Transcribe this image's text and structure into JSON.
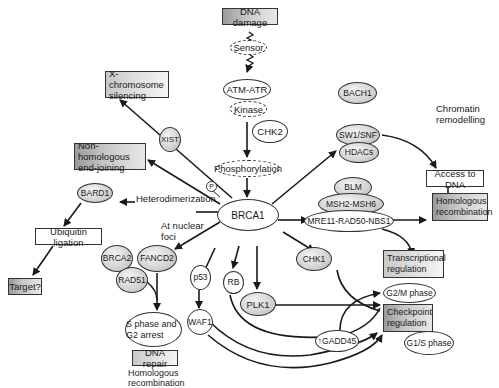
{
  "diagram": {
    "nodes": {
      "dna_damage": "DNA damage",
      "sensor": "Sensor",
      "atm_atr": "ATM-ATR",
      "kinase": "Kinase",
      "chk2": "CHK2",
      "phosphorylation": "Phosphorylation",
      "brca1": "BRCA1",
      "p_marker": "P",
      "x_chromosome_silencing": "X-chromosome silencing",
      "xist": "XIST",
      "nhej": "Non-homologous end-joining",
      "bard1": "BARD1",
      "ubiquitin_ligation": "Ubiquitin ligation",
      "target": "Target?",
      "brca2": "BRCA2",
      "fancd2": "FANCD2",
      "rad51": "RAD51",
      "s_phase_g2_arrest": "S phase and G2 arrest",
      "dna_repair": "DNA repair",
      "p53": "p53",
      "waf1": "WAF1",
      "rb": "RB",
      "plk1": "PLK1",
      "chk1": "CHK1",
      "bach1": "BACH1",
      "swi_snf": "SW1/SNF",
      "hdacs": "HDACs",
      "access_to_dna": "Access to DNA",
      "blm": "BLM",
      "msh2_msh6": "MSH2-MSH6",
      "mre11_rad50_nbs1": "MRE11-RAD50-NBS1",
      "homologous_recombination_box": "Homologous recombination",
      "transcriptional_regulation": "Transcriptional regulation",
      "g2m_phase": "G2/M phase",
      "checkpoint_regulation": "Checkpoint regulation",
      "g1s_phase": "G1/S phase",
      "gadd45": "↑GADD45"
    },
    "labels": {
      "heterodimerization": "Heterodimerization",
      "at_nuclear_foci": "At nuclear foci",
      "chromatin_remodelling": "Chromatin remodelling",
      "homologous_recombination_text": "Homologous recombination"
    },
    "colors": {
      "line": "#1a1a1a",
      "gray_fill": "#c8c8c8",
      "dark_box_fill": "#9a9a9a"
    }
  }
}
